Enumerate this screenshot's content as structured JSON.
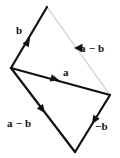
{
  "diagram": {
    "type": "vector-diagram",
    "colors": {
      "stroke_main": "#111111",
      "stroke_faint": "#d9d9d9",
      "background": "#ffffff",
      "text": "#111111"
    },
    "vertices": {
      "top": {
        "x": 47,
        "y": 7
      },
      "left": {
        "x": 11,
        "y": 68
      },
      "right": {
        "x": 110,
        "y": 95
      },
      "bottom": {
        "x": 75,
        "y": 152
      }
    },
    "edges": [
      {
        "name": "b-edge",
        "label": "b",
        "from": "left",
        "to": "top",
        "style": "solid",
        "arrow_at": {
          "x": 30,
          "y": 38
        },
        "arrow_angle": -59
      },
      {
        "name": "a-minus-b-faint-edge",
        "label": "a − b",
        "from": "top",
        "to": "right",
        "style": "faint",
        "arrow_at": {
          "x": 74,
          "y": 48
        },
        "arrow_angle": 180
      },
      {
        "name": "a-edge",
        "label": "a",
        "from": "left",
        "to": "right",
        "style": "solid",
        "arrow_at": {
          "x": 58,
          "y": 80
        },
        "arrow_angle": 15
      },
      {
        "name": "a-minus-b-edge",
        "label": "a − b",
        "from": "left",
        "to": "bottom",
        "style": "solid",
        "arrow_at": {
          "x": 45,
          "y": 113
        },
        "arrow_angle": 53
      },
      {
        "name": "minus-b-edge",
        "label": "−b",
        "from": "right",
        "to": "bottom",
        "style": "solid",
        "arrow_at": {
          "x": 92,
          "y": 124
        },
        "arrow_angle": 122
      }
    ],
    "labels": {
      "b_top": "b",
      "a_minus_b_right": "a − b",
      "a_mid": "a",
      "a_minus_b_left": "a − b",
      "minus_b_right": "−b"
    }
  }
}
